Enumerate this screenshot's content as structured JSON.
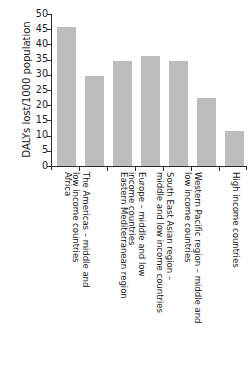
{
  "chart_data": {
    "type": "bar",
    "title": "",
    "xlabel": "",
    "ylabel": "DALYs lost/1000 population",
    "ylim": [
      0,
      50
    ],
    "yticks": [
      0,
      5,
      10,
      15,
      20,
      25,
      30,
      35,
      40,
      45,
      50
    ],
    "ytick_labels": [
      "0",
      "5",
      "10",
      "15",
      "20",
      "25",
      "30",
      "35",
      "40",
      "45",
      "50"
    ],
    "grid": false,
    "legend": false,
    "bar_color": "#bdbdbd",
    "axis_color": "#2b2b2b",
    "categories": [
      "Africa",
      "The Americas – middle and\nlow income countries",
      "Eastern Mediterranean region",
      "Europe – middle and low\nincome countries",
      "South East Asian region –\nmiddle and low income countries",
      "Western Pacific region – middle and\nlow income countries",
      "High income countries"
    ],
    "values": [
      45.7,
      29.7,
      34.6,
      36.2,
      34.7,
      22.5,
      11.5
    ]
  }
}
